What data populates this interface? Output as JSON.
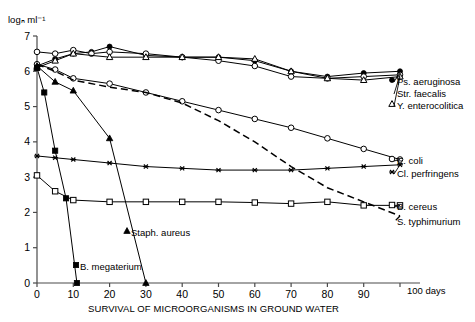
{
  "chart_data": {
    "type": "line",
    "title": "SURVIVAL OF MICROORGANISMS IN GROUND WATER",
    "xlabel": "days",
    "ylabel": "logₙ ml⁻¹",
    "xlim": [
      0,
      100
    ],
    "ylim": [
      0,
      7
    ],
    "grid": false,
    "legend_position": "right-inline",
    "x_ticks": [
      "0",
      "10",
      "20",
      "30",
      "40",
      "50",
      "60",
      "70",
      "80",
      "90",
      "100"
    ],
    "x_axis_unit": "days",
    "y_ticks": [
      "0",
      "1",
      "2",
      "3",
      "4",
      "5",
      "6",
      "7"
    ],
    "series": [
      {
        "name": "Ps. aeruginosa",
        "marker": "filled-circle",
        "line": "solid",
        "x": [
          0,
          5,
          10,
          15,
          20,
          30,
          40,
          50,
          60,
          70,
          80,
          90,
          100
        ],
        "values": [
          6.15,
          6.35,
          6.5,
          6.55,
          6.7,
          6.45,
          6.4,
          6.4,
          6.3,
          6.0,
          5.85,
          5.95,
          6.0
        ]
      },
      {
        "name": "Str. faecalis",
        "marker": "open-circle",
        "line": "solid",
        "x": [
          0,
          5,
          10,
          15,
          20,
          30,
          40,
          50,
          60,
          70,
          80,
          90,
          100
        ],
        "values": [
          6.55,
          6.5,
          6.6,
          6.5,
          6.55,
          6.5,
          6.4,
          6.3,
          6.15,
          5.85,
          5.8,
          5.85,
          5.9
        ]
      },
      {
        "name": "Y. enterocolitica",
        "marker": "open-triangle",
        "line": "solid",
        "x": [
          0,
          5,
          10,
          20,
          30,
          40,
          50,
          60,
          70,
          80,
          90,
          100
        ],
        "values": [
          6.1,
          6.3,
          6.5,
          6.4,
          6.4,
          6.4,
          6.4,
          6.35,
          6.0,
          5.8,
          5.75,
          5.85
        ]
      },
      {
        "name": "E. coli",
        "marker": "open-circle",
        "line": "solid",
        "x": [
          0,
          5,
          10,
          20,
          30,
          40,
          50,
          60,
          70,
          80,
          90,
          100
        ],
        "values": [
          6.2,
          6.05,
          5.8,
          5.65,
          5.4,
          5.15,
          4.9,
          4.65,
          4.4,
          4.1,
          3.8,
          3.5
        ]
      },
      {
        "name": "Cl. perfringens",
        "marker": "asterisk",
        "line": "solid",
        "x": [
          0,
          5,
          10,
          20,
          30,
          40,
          50,
          60,
          70,
          80,
          90,
          100
        ],
        "values": [
          3.6,
          3.55,
          3.5,
          3.4,
          3.3,
          3.25,
          3.2,
          3.2,
          3.2,
          3.25,
          3.3,
          3.35
        ]
      },
      {
        "name": "B. cereus",
        "marker": "open-square",
        "line": "solid",
        "x": [
          0,
          5,
          10,
          20,
          30,
          40,
          50,
          60,
          70,
          80,
          90,
          100
        ],
        "values": [
          3.05,
          2.6,
          2.35,
          2.3,
          2.3,
          2.3,
          2.3,
          2.28,
          2.25,
          2.3,
          2.2,
          2.2
        ]
      },
      {
        "name": "S. typhimurium",
        "marker": "none",
        "line": "dashed",
        "x": [
          0,
          5,
          10,
          20,
          30,
          40,
          50,
          60,
          70,
          80,
          90,
          100
        ],
        "values": [
          6.2,
          6.0,
          5.75,
          5.55,
          5.4,
          5.1,
          4.6,
          4.0,
          3.3,
          2.7,
          2.3,
          1.9
        ]
      },
      {
        "name": "Staph. aureus",
        "marker": "filled-triangle",
        "line": "solid",
        "x": [
          0,
          5,
          10,
          20,
          30
        ],
        "values": [
          6.15,
          5.7,
          5.45,
          4.1,
          0.0
        ]
      },
      {
        "name": "B. megaterium",
        "marker": "filled-square",
        "line": "solid",
        "x": [
          0,
          2,
          5,
          8,
          11
        ],
        "values": [
          6.1,
          5.4,
          3.75,
          2.4,
          0.0
        ]
      }
    ]
  },
  "labels": {
    "y_axis_caption": "logₙ ml⁻¹",
    "x_axis_caption": "SURVIVAL OF MICROORGANISMS IN GROUND WATER",
    "x_unit_label": "100 days",
    "ps_aeruginosa": "Ps. aeruginosa",
    "str_faecalis": "Str. faecalis",
    "y_enterocolitica": "Y. enterocolitica",
    "e_coli": "E. coli",
    "cl_perfringens": "Cl. perfringens",
    "b_cereus": "B. cereus",
    "s_typhimurium": "S. typhimurium",
    "staph_aureus": "Staph. aureus",
    "b_megaterium": "B. megaterium"
  },
  "ticks": {
    "y": [
      "7",
      "6",
      "5",
      "4",
      "3",
      "2",
      "1",
      "0"
    ],
    "x": [
      "0",
      "10",
      "20",
      "30",
      "40",
      "50",
      "60",
      "70",
      "80",
      "90"
    ]
  },
  "colors": {
    "ink": "#000000",
    "background": "#ffffff"
  }
}
